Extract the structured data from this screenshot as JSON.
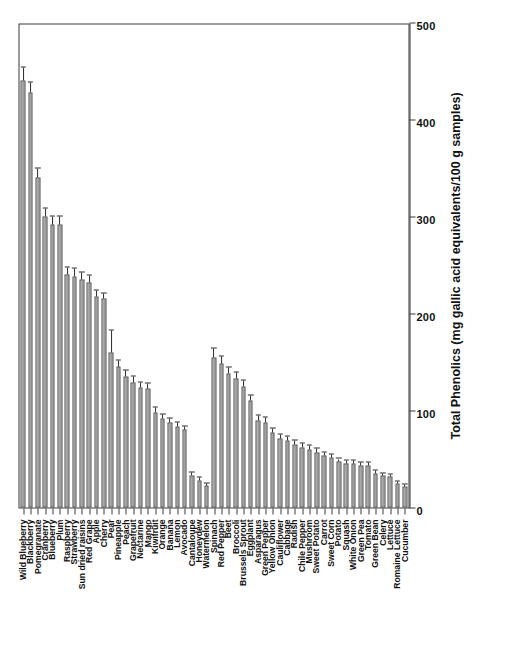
{
  "chart_data": {
    "type": "bar",
    "orientation": "vertical-rotated",
    "title": "",
    "xlabel": "",
    "ylabel": "Total Phenolics (mg gallic acid equivalents/100 g samples)",
    "ylim": [
      0,
      500
    ],
    "yticks": [
      0,
      100,
      200,
      300,
      400,
      500
    ],
    "grid": false,
    "legend": null,
    "errorbars": true,
    "bar_color": "#a8a8a8",
    "bar_edge_color": "#4a4a4a",
    "categories": [
      "Wild Blueberry",
      "Blackberry",
      "Pomegranate",
      "Cranberry",
      "Blueberry",
      "Plum",
      "Raspberry",
      "Strawberry",
      "Sun dried raisins",
      "Red Grape",
      "Apple",
      "Cherry",
      "Pear",
      "Pineapple",
      "Peach",
      "Grapefruit",
      "Nectarine",
      "Mango",
      "Kiwifruit",
      "Orange",
      "Banana",
      "Lemon",
      "Avocado",
      "Cantaloupe",
      "Honeydew",
      "Watermelon",
      "Spinach",
      "Red Pepper",
      "Beet",
      "Broccoli",
      "Brussels Sprout",
      "Eggplant",
      "Asparagus",
      "Green Pepper",
      "Yellow Onion",
      "Cauliflower",
      "Cabbage",
      "Radish",
      "Chile Pepper",
      "Mushroom",
      "Sweet Potato",
      "Carrot",
      "Sweet Corn",
      "Potato",
      "Squash",
      "White Onion",
      "Green Pea",
      "Tomato",
      "Green Bean",
      "Celery",
      "Lettuce",
      "Romaine Lettuce",
      "Cucumber"
    ],
    "values": [
      440,
      428,
      340,
      300,
      292,
      292,
      240,
      238,
      235,
      232,
      218,
      215,
      160,
      145,
      135,
      129,
      124,
      123,
      98,
      92,
      88,
      84,
      80,
      33,
      28,
      23,
      155,
      148,
      138,
      133,
      125,
      110,
      90,
      88,
      77,
      71,
      69,
      65,
      62,
      60,
      57,
      54,
      52,
      47,
      45,
      45,
      43,
      43,
      35,
      33,
      32,
      25,
      22
    ],
    "errors": [
      14,
      10,
      9,
      8,
      8,
      8,
      7,
      8,
      7,
      7,
      6,
      6,
      22,
      7,
      6,
      6,
      5,
      5,
      5,
      4,
      4,
      4,
      4,
      3,
      3,
      2,
      9,
      8,
      6,
      6,
      6,
      5,
      5,
      5,
      4,
      4,
      4,
      4,
      4,
      4,
      4,
      3,
      3,
      3,
      3,
      3,
      3,
      3,
      3,
      2,
      2,
      2,
      2
    ]
  }
}
